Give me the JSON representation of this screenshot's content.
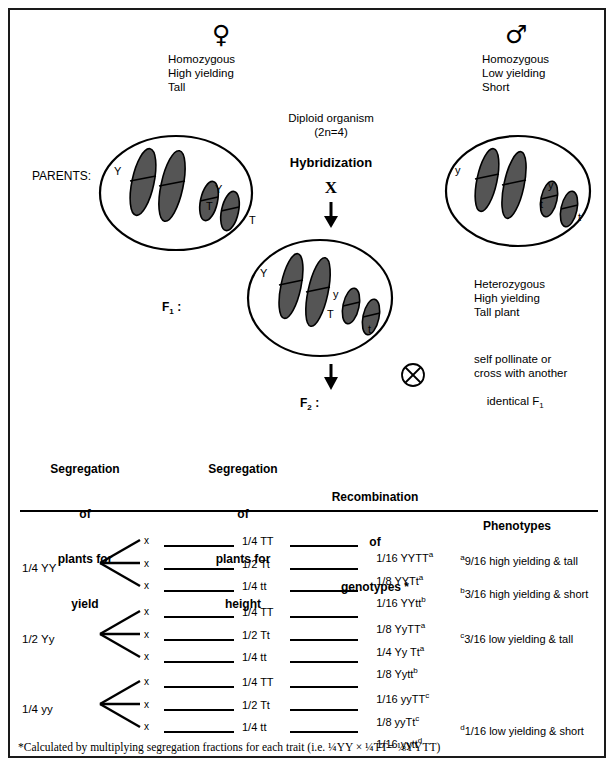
{
  "diagram": {
    "title_symbols": {
      "female": "♀",
      "male": "♂"
    },
    "left_parent": {
      "symbol_name": "female-symbol",
      "lines": [
        "Homozygous",
        "High yielding",
        "Tall"
      ],
      "chromosome_labels": [
        "Y",
        "Y",
        "T",
        "T"
      ]
    },
    "right_parent": {
      "symbol_name": "male-symbol",
      "lines": [
        "Homozygous",
        "Low yielding",
        "Short"
      ],
      "chromosome_labels": [
        "y",
        "y",
        "t",
        "t"
      ]
    },
    "center": {
      "diploid_line1": "Diploid organism",
      "diploid_line2": "(2n=4)",
      "hybridization": "Hybridization",
      "cross_mark": "X",
      "f1_cell_labels": [
        "Y",
        "y",
        "T",
        "t"
      ],
      "self_cross_symbol": "⊗"
    },
    "parents_label": "PARENTS:",
    "f1_label_main": "F",
    "f1_label_sub": "1",
    "f1_label_colon": " :",
    "f2_label_main": "F",
    "f2_label_sub": "2",
    "f2_label_colon": " :",
    "f1_description": [
      "Heterozygous",
      "High yielding",
      "Tall plant"
    ],
    "self_pollinate": [
      "self pollinate or",
      "cross with another",
      "identical F"
    ],
    "self_pollinate_sub": "1"
  },
  "table": {
    "headers": [
      {
        "name": "yield",
        "lines": [
          "Segregation",
          "of",
          "plants for",
          "yield"
        ]
      },
      {
        "name": "height",
        "lines": [
          "Segregation",
          "of",
          "plants for",
          "height"
        ]
      },
      {
        "name": "genotypes",
        "lines": [
          "Recombination",
          "of",
          "genotypes *"
        ]
      },
      {
        "name": "phenotypes",
        "lines": [
          "Phenotypes"
        ]
      }
    ],
    "groups": [
      {
        "yield": "1/4 YY",
        "branches": [
          {
            "x": "x",
            "height": "1/4 TT",
            "genotype": "1/16 YYTT",
            "genotype_sup": "a"
          },
          {
            "x": "x",
            "height": "1/2 Tt",
            "genotype": "1/8 YYTt",
            "genotype_sup": "a"
          },
          {
            "x": "x",
            "height": "1/4 tt",
            "genotype": "1/16 YYtt",
            "genotype_sup": "b"
          }
        ]
      },
      {
        "yield": "1/2 Yy",
        "branches": [
          {
            "x": "x",
            "height": "1/4 TT",
            "genotype": "1/8 YyTT",
            "genotype_sup": "a"
          },
          {
            "x": "x",
            "height": "1/2 Tt",
            "genotype": "1/4 Yy Tt",
            "genotype_sup": "a"
          },
          {
            "x": "x",
            "height": "1/4 tt",
            "genotype": "1/8 Yytt",
            "genotype_sup": "b"
          }
        ]
      },
      {
        "yield": "1/4 yy",
        "branches": [
          {
            "x": "x",
            "height": "1/4 TT",
            "genotype": "1/16 yyTT",
            "genotype_sup": "c"
          },
          {
            "x": "x",
            "height": "1/2 Tt",
            "genotype": "1/8 yyTt",
            "genotype_sup": "c"
          },
          {
            "x": "x",
            "height": "1/4 tt",
            "genotype": "1/16 yytt",
            "genotype_sup": "d"
          }
        ]
      }
    ],
    "phenotypes": [
      {
        "sup": "a",
        "text": "9/16 high yielding & tall"
      },
      {
        "sup": "b",
        "text": "3/16 high yielding & short"
      },
      {
        "sup": "c",
        "text": "3/16 low yielding & tall"
      },
      {
        "sup": "d",
        "text": "1/16 low yielding & short"
      }
    ]
  },
  "footnote": "*Calculated by multiplying segregation fractions for each trait (i.e. ¼YY × ¼TT= ⅛YYTT)"
}
